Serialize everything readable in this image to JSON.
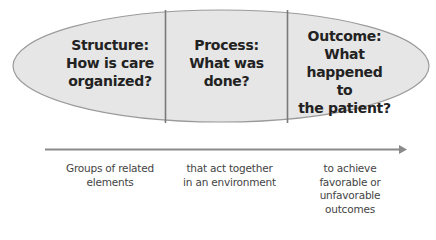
{
  "diagram": {
    "type": "ellipse-segmented-with-arrow",
    "colors": {
      "ellipse_fill": "#e6e6e6",
      "ellipse_stroke": "#9a9a9a",
      "divider": "#7a7a7a",
      "arrow": "#8a8a8a",
      "text_bold": "#222222",
      "text_caption": "#444444"
    },
    "segments": [
      {
        "id": "structure",
        "lines": [
          "Structure:",
          "How is care",
          "organized?"
        ]
      },
      {
        "id": "process",
        "lines": [
          "Process:",
          "What was",
          "done?"
        ]
      },
      {
        "id": "outcome",
        "lines": [
          "Outcome:",
          "What",
          "happened to",
          "the patient?"
        ]
      }
    ],
    "captions": [
      {
        "id": "groups",
        "lines": [
          "Groups of related",
          "elements"
        ]
      },
      {
        "id": "act-together",
        "lines": [
          "that act together",
          "in an environment"
        ]
      },
      {
        "id": "achieve",
        "lines": [
          "to achieve",
          "favorable or",
          "unfavorable",
          "outcomes"
        ]
      }
    ]
  }
}
